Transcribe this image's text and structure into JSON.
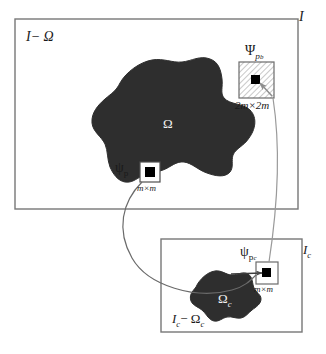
{
  "figure": {
    "type": "diagram",
    "colors": {
      "region_fill": "#2b2b2b",
      "frame_stroke": "#6e6e6e",
      "patch_stroke": "#555555",
      "patch_center": "#000000",
      "background": "#ffffff",
      "label_on_dark": "#f2f2f2",
      "hatch_line": "#8a8a8a"
    },
    "outer_frame": {
      "name": "image-frame",
      "label": "I",
      "background_label": "I− Ω"
    },
    "region": {
      "name": "target-region",
      "label": "Ω"
    },
    "source_patch": {
      "name": "source-patch",
      "symbol": "ψ",
      "subscript": "p",
      "size_label": "m×m"
    },
    "big_patch": {
      "name": "big-patch",
      "symbol": "Ψ",
      "subscript": "p",
      "subscript2": "b",
      "size_label": "2m×2m",
      "fill": "hatched"
    },
    "inner_frame": {
      "name": "coarse-image-frame",
      "label": "I",
      "label_sub": "c",
      "background_label": "I",
      "background_label_sub": "c",
      "background_label_rest": "− Ω",
      "background_label_rest_sub": "c"
    },
    "inner_region": {
      "name": "coarse-target-region",
      "label": "Ω",
      "label_sub": "c"
    },
    "coarse_patch": {
      "name": "coarse-patch",
      "symbol": "ψ",
      "subscript": "p",
      "subscript2": "c",
      "size_label": "m×m"
    },
    "connectors": [
      {
        "name": "patch-to-coarse-curve",
        "from": "source-patch",
        "to": "coarse-patch"
      },
      {
        "name": "bigpatch-to-coarse-line",
        "from": "big-patch",
        "to": "coarse-patch"
      },
      {
        "name": "coarse-region-arrow",
        "from": "coarse-target-region",
        "to": "coarse-patch"
      },
      {
        "name": "bigpatch-inner-arrow",
        "from": "big-patch-corner",
        "to": "big-patch-center"
      }
    ]
  }
}
